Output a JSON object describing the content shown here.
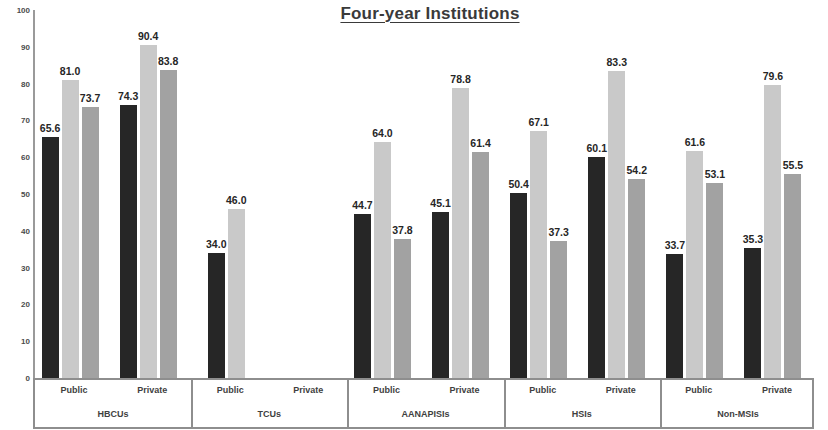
{
  "chart": {
    "title": "Four-year Institutions"
  },
  "chart_data": {
    "type": "bar",
    "title": "Four-year Institutions",
    "xlabel": "",
    "ylabel": "",
    "ylim": [
      0,
      100
    ],
    "yticks": [
      0,
      10,
      20,
      30,
      40,
      50,
      60,
      70,
      80,
      90,
      100
    ],
    "grid": false,
    "legend": "none",
    "categories": [
      "HBCUs - Public",
      "HBCUs - Private",
      "TCUs - Public",
      "TCUs - Private",
      "AANAPISIs - Public",
      "AANAPISIs - Private",
      "HSIs - Public",
      "HSIs - Private",
      "Non-MSIs - Public",
      "Non-MSIs - Private"
    ],
    "groups": [
      {
        "name": "HBCUs",
        "subgroups": [
          {
            "name": "Public",
            "values": [
              65.6,
              81.0,
              73.7
            ]
          },
          {
            "name": "Private",
            "values": [
              74.3,
              90.4,
              83.8
            ]
          }
        ]
      },
      {
        "name": "TCUs",
        "subgroups": [
          {
            "name": "Public",
            "values": [
              34.0,
              46.0,
              null
            ]
          },
          {
            "name": "Private",
            "values": [
              null,
              null,
              null
            ]
          }
        ]
      },
      {
        "name": "AANAPISIs",
        "subgroups": [
          {
            "name": "Public",
            "values": [
              44.7,
              64.0,
              37.8
            ]
          },
          {
            "name": "Private",
            "values": [
              45.1,
              78.8,
              61.4
            ]
          }
        ]
      },
      {
        "name": "HSIs",
        "subgroups": [
          {
            "name": "Public",
            "values": [
              50.4,
              67.1,
              37.3
            ]
          },
          {
            "name": "Private",
            "values": [
              60.1,
              83.3,
              54.2
            ]
          }
        ]
      },
      {
        "name": "Non-MSIs",
        "subgroups": [
          {
            "name": "Public",
            "values": [
              33.7,
              61.6,
              53.1
            ]
          },
          {
            "name": "Private",
            "values": [
              35.3,
              79.6,
              55.5
            ]
          }
        ]
      }
    ],
    "series": [
      {
        "name": "series-1",
        "color": "#262626",
        "values": [
          65.6,
          74.3,
          34.0,
          null,
          44.7,
          45.1,
          50.4,
          60.1,
          33.7,
          35.3
        ]
      },
      {
        "name": "series-2",
        "color": "#c9c9c9",
        "values": [
          81.0,
          90.4,
          46.0,
          null,
          64.0,
          78.8,
          67.1,
          83.3,
          61.6,
          79.6
        ]
      },
      {
        "name": "series-3",
        "color": "#a2a2a2",
        "values": [
          73.7,
          83.8,
          null,
          null,
          37.8,
          61.4,
          37.3,
          54.2,
          53.1,
          55.5
        ]
      }
    ]
  },
  "colors": {
    "series_1": "#262626",
    "series_2": "#c9c9c9",
    "series_3": "#a2a2a2",
    "axis": "#8e8e8e",
    "text": "#3f3f3f",
    "title": "#3a3a3a"
  }
}
